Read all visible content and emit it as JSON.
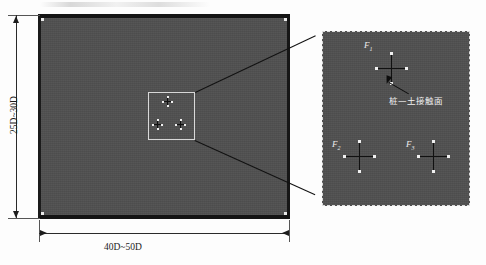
{
  "figure": {
    "type": "engineering-schematic"
  },
  "dimensions": {
    "vertical": {
      "label": "25D~30D",
      "name": "model-height"
    },
    "horizontal": {
      "label": "40D~50D",
      "name": "model-width"
    }
  },
  "soil_block": {
    "fill_color": "#4f4f4f",
    "border_color": "#141414"
  },
  "inset": {
    "border_color": "#d8d8d8",
    "piles": [
      {
        "id": "pile-top",
        "x": 19,
        "y": 6
      },
      {
        "id": "pile-left",
        "x": 6,
        "y": 29
      },
      {
        "id": "pile-right",
        "x": 31,
        "y": 29
      }
    ]
  },
  "detail_panel": {
    "border_color": "#dcdcdc",
    "fill_color": "#4f4f4f",
    "piles": [
      {
        "id": "pile-F1-top",
        "label": "F",
        "subscript": "1",
        "x": 54,
        "y": 22
      },
      {
        "id": "pile-F2-left",
        "label": "F",
        "subscript": "2",
        "x": 22,
        "y": 110
      },
      {
        "id": "pile-F3-right",
        "label": "F",
        "subscript": "3",
        "x": 96,
        "y": 110
      }
    ],
    "annotation": {
      "text": "桩—土接触面",
      "meaning": "pile-soil interface"
    }
  }
}
